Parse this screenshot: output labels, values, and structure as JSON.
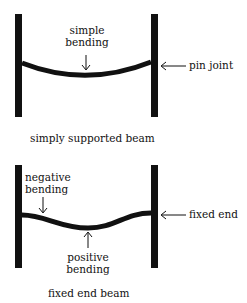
{
  "top_diagram": {
    "label_bending_line1": "simple",
    "label_bending_line2": "bending",
    "label_joint": "pin joint",
    "caption": "simply supported beam"
  },
  "bottom_diagram": {
    "label_negative_line1": "negative",
    "label_negative_line2": "bending",
    "label_positive_line1": "positive",
    "label_positive_line2": "bending",
    "label_end": "fixed end",
    "caption": "fixed end beam"
  },
  "colors": {
    "ink": "#111111",
    "background": "#ffffff"
  }
}
